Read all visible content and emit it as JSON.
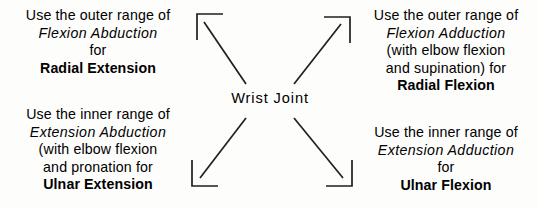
{
  "diagram": {
    "center_label": "Wrist Joint",
    "stroke_color": "#1a1a1a",
    "background_color": "#fdfdfc",
    "text_color": "#000000",
    "quadrants": {
      "top_left": {
        "position": "top-left",
        "arrow_direction": "up-left",
        "lines": [
          {
            "text": "Use the outer range of",
            "style": "normal"
          },
          {
            "text": "Flexion Abduction",
            "style": "italic"
          },
          {
            "text": "for",
            "style": "normal"
          },
          {
            "text": "Radial Extension",
            "style": "bold"
          }
        ]
      },
      "top_right": {
        "position": "top-right",
        "arrow_direction": "up-right",
        "lines": [
          {
            "text": "Use the outer range of",
            "style": "normal"
          },
          {
            "text": "Flexion Adduction",
            "style": "italic"
          },
          {
            "text": "(with elbow flexion",
            "style": "normal"
          },
          {
            "text": "and supination) for",
            "style": "normal"
          },
          {
            "text": "Radial Flexion",
            "style": "bold"
          }
        ]
      },
      "bottom_left": {
        "position": "bottom-left",
        "arrow_direction": "down-left",
        "lines": [
          {
            "text": "Use the inner range of",
            "style": "normal"
          },
          {
            "text": "Extension Abduction",
            "style": "italic"
          },
          {
            "text": "(with elbow flexion",
            "style": "normal"
          },
          {
            "text": "and pronation for",
            "style": "normal"
          },
          {
            "text": "Ulnar Extension",
            "style": "bold"
          }
        ]
      },
      "bottom_right": {
        "position": "bottom-right",
        "arrow_direction": "down-right",
        "lines": [
          {
            "text": "Use the inner range of",
            "style": "normal"
          },
          {
            "text": "Extension Adduction",
            "style": "italic"
          },
          {
            "text": "for",
            "style": "normal"
          },
          {
            "text": "Ulnar Flexion",
            "style": "bold"
          }
        ]
      }
    }
  }
}
